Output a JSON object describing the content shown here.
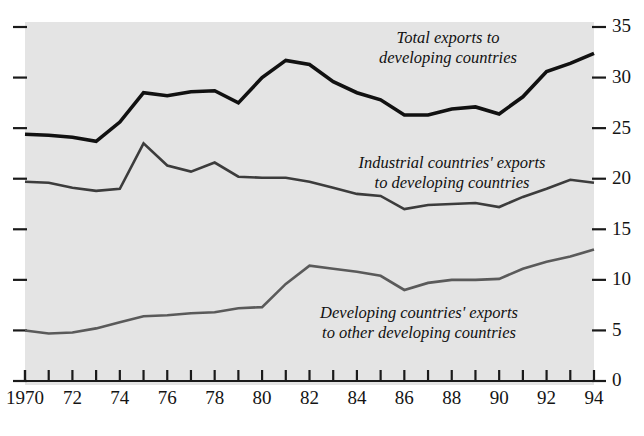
{
  "chart_data": {
    "type": "line",
    "title": "",
    "xlabel": "",
    "ylabel": "",
    "x": [
      1970,
      1971,
      1972,
      1973,
      1974,
      1975,
      1976,
      1977,
      1978,
      1979,
      1980,
      1981,
      1982,
      1983,
      1984,
      1985,
      1986,
      1987,
      1988,
      1989,
      1990,
      1991,
      1992,
      1993,
      1994
    ],
    "xlim": [
      1970,
      1994
    ],
    "ylim": [
      0,
      35
    ],
    "yticks": [
      0,
      5,
      10,
      15,
      20,
      25,
      30,
      35
    ],
    "xticks_labeled": [
      "1970",
      "72",
      "74",
      "76",
      "78",
      "80",
      "82",
      "84",
      "86",
      "88",
      "90",
      "92",
      "94"
    ],
    "xtick_every": 1,
    "grid": false,
    "legend": "inline-annotations",
    "background_color": "#e4e4e4",
    "series": [
      {
        "name": "Total exports to developing countries",
        "color": "#111111",
        "stroke_width": 3.6,
        "values": [
          24.4,
          24.3,
          24.1,
          23.7,
          25.6,
          28.5,
          28.2,
          28.6,
          28.7,
          27.5,
          30.0,
          31.7,
          31.3,
          29.6,
          28.5,
          27.8,
          26.3,
          26.3,
          26.9,
          27.1,
          26.4,
          28.1,
          30.6,
          31.4,
          32.4
        ]
      },
      {
        "name": "Industrial countries' exports to developing countries",
        "color": "#3c3c3c",
        "stroke_width": 2.6,
        "values": [
          19.7,
          19.6,
          19.1,
          18.8,
          19.0,
          23.5,
          21.3,
          20.7,
          21.6,
          20.2,
          20.1,
          20.1,
          19.7,
          19.1,
          18.5,
          18.3,
          17.0,
          17.4,
          17.5,
          17.6,
          17.2,
          18.2,
          19.0,
          19.9,
          19.6
        ]
      },
      {
        "name": "Developing countries' exports to other developing countries",
        "color": "#5a5a5a",
        "stroke_width": 2.6,
        "values": [
          5.0,
          4.7,
          4.8,
          5.2,
          5.8,
          6.4,
          6.5,
          6.7,
          6.8,
          7.2,
          7.3,
          9.6,
          11.4,
          11.1,
          10.8,
          10.4,
          9.0,
          9.7,
          10.0,
          10.0,
          10.1,
          11.1,
          11.8,
          12.3,
          13.0
        ]
      }
    ],
    "annotations": [
      {
        "name": "total-exports-label",
        "lines": [
          "Total exports to",
          "developing countries"
        ],
        "x_px": 448,
        "y_px": 43
      },
      {
        "name": "industrial-exports-label",
        "lines": [
          "Industrial countries' exports",
          "to developing countries"
        ],
        "x_px": 452,
        "y_px": 168
      },
      {
        "name": "developing-exports-label",
        "lines": [
          "Developing countries' exports",
          "to other developing countries"
        ],
        "x_px": 419,
        "y_px": 318
      }
    ]
  }
}
